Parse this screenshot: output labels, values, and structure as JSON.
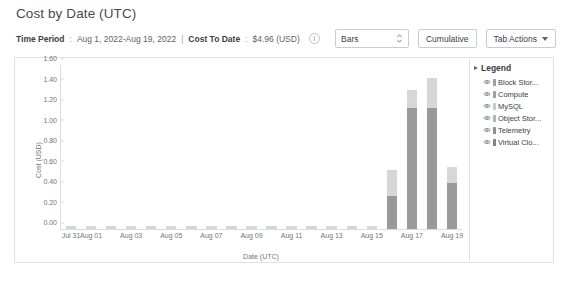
{
  "header": {
    "title": "Cost by Date (UTC)"
  },
  "meta": {
    "time_period_label": "Time Period",
    "time_period_sep": ":",
    "time_period_value": "Aug 1, 2022-Aug 19, 2022",
    "divider": "|",
    "cost_to_date_label": "Cost To Date",
    "cost_to_date_sep": ":",
    "cost_to_date_value": "$4.96 (USD)",
    "info_icon_glyph": "i",
    "info_icon_name": "info-icon"
  },
  "toolbar": {
    "chart_type_value": "Bars",
    "cumulative_label": "Cumulative",
    "tab_actions_label": "Tab Actions"
  },
  "legend": {
    "title": "Legend",
    "items": [
      {
        "label": "Block Stor...",
        "color": "#9aa0a6"
      },
      {
        "label": "Compute",
        "color": "#9aa0a6"
      },
      {
        "label": "MySQL",
        "color": "#c6cace"
      },
      {
        "label": "Object Stor...",
        "color": "#b0b4b8"
      },
      {
        "label": "Telemetry",
        "color": "#8a9096"
      },
      {
        "label": "Virtual Clo...",
        "color": "#7d8388"
      }
    ]
  },
  "chart_data": {
    "type": "bar",
    "title": "Cost by Date (UTC)",
    "xlabel": "Date (UTC)",
    "ylabel": "Cost (USD)",
    "ylim": [
      0,
      1.6
    ],
    "yticks": [
      "0.00",
      "0.20",
      "0.40",
      "0.60",
      "0.80",
      "1.00",
      "1.20",
      "1.40",
      "1.60"
    ],
    "grid": false,
    "legend_position": "right",
    "stacked": true,
    "categories": [
      "Jul 31",
      "Aug 01",
      "Aug 02",
      "Aug 03",
      "Aug 04",
      "Aug 05",
      "Aug 06",
      "Aug 07",
      "Aug 08",
      "Aug 09",
      "Aug 10",
      "Aug 11",
      "Aug 12",
      "Aug 13",
      "Aug 14",
      "Aug 15",
      "Aug 16",
      "Aug 17",
      "Aug 18",
      "Aug 19"
    ],
    "xtick_labels": [
      "Jul 31",
      "Aug 01",
      "Aug 03",
      "Aug 05",
      "Aug 07",
      "Aug 09",
      "Aug 11",
      "Aug 13",
      "Aug 15",
      "Aug 17",
      "Aug 19"
    ],
    "xtick_indices": [
      0,
      1,
      3,
      5,
      7,
      9,
      11,
      13,
      15,
      17,
      19
    ],
    "series": [
      {
        "name": "dark",
        "color": "#9a9a9a",
        "values": [
          0.0,
          0.0,
          0.0,
          0.0,
          0.0,
          0.0,
          0.0,
          0.0,
          0.0,
          0.0,
          0.0,
          0.0,
          0.0,
          0.0,
          0.0,
          0.0,
          0.32,
          1.18,
          1.18,
          0.45
        ]
      },
      {
        "name": "light",
        "color": "#d7d7d7",
        "values": [
          0.03,
          0.03,
          0.03,
          0.03,
          0.03,
          0.03,
          0.03,
          0.03,
          0.03,
          0.03,
          0.03,
          0.03,
          0.03,
          0.03,
          0.03,
          0.03,
          0.26,
          0.18,
          0.29,
          0.16
        ]
      }
    ],
    "totals": [
      0.03,
      0.03,
      0.03,
      0.03,
      0.03,
      0.03,
      0.03,
      0.03,
      0.03,
      0.03,
      0.03,
      0.03,
      0.03,
      0.03,
      0.03,
      0.03,
      0.58,
      1.36,
      1.47,
      0.61
    ]
  }
}
